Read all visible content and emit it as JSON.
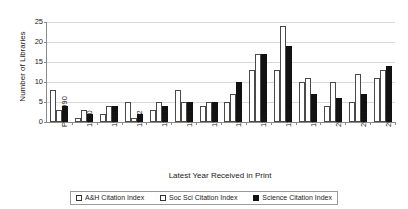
{
  "chart_data": {
    "type": "bar",
    "title": "",
    "xlabel": "Latest Year Received in Print",
    "ylabel": "Number of Libraries",
    "ylim": [
      0,
      25
    ],
    "yticks": [
      0,
      5,
      10,
      15,
      20,
      25
    ],
    "grid": true,
    "legend_position": "bottom",
    "categories": [
      "Pre-1990",
      "1990",
      "1991",
      "1992",
      "1993",
      "1994",
      "1995",
      "1996",
      "1997",
      "1998",
      "1999",
      "2000",
      "2001",
      "2002"
    ],
    "series": [
      {
        "name": "A&H Citation Index",
        "color": "#ffffff",
        "values": [
          8,
          1,
          2,
          5,
          3,
          8,
          4,
          5,
          13,
          13,
          10,
          4,
          5,
          11
        ]
      },
      {
        "name": "Soc Sci Citation Index",
        "color": "#ffffff",
        "values": [
          3,
          3,
          4,
          1,
          5,
          5,
          5,
          7,
          17,
          24,
          11,
          10,
          12,
          13
        ]
      },
      {
        "name": "Science Citation Index",
        "color": "#111111",
        "values": [
          4,
          2,
          4,
          2,
          4,
          5,
          5,
          10,
          17,
          19,
          7,
          6,
          7,
          14
        ]
      }
    ]
  },
  "axes": {
    "y_title": "Number of Libraries",
    "x_title": "Latest Year Received in Print"
  },
  "legend": {
    "items": [
      {
        "label": "A&H Citation Index"
      },
      {
        "label": "Soc Sci Citation Index"
      },
      {
        "label": "Science Citation Index"
      }
    ]
  }
}
